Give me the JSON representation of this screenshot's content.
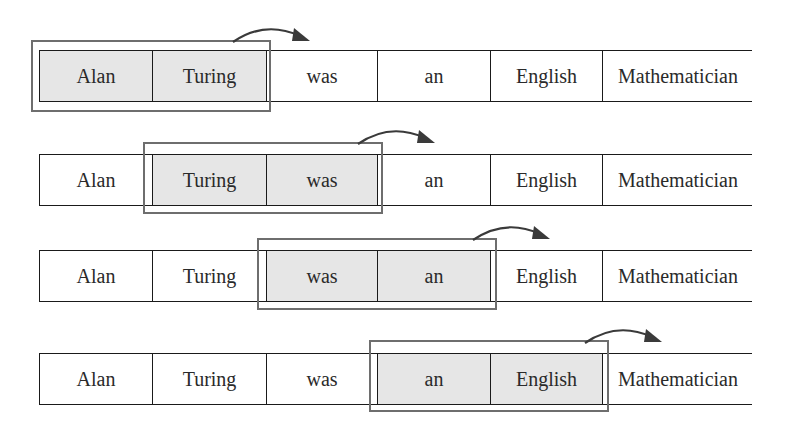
{
  "diagram": {
    "tokens": [
      "Alan",
      "Turing",
      "was",
      "an",
      "English",
      "Mathematician"
    ],
    "rows": [
      {
        "step": 1,
        "window": [
          0,
          1
        ],
        "cells": [
          "Alan",
          "Turing",
          "was",
          "an",
          "English",
          "Mathematician"
        ]
      },
      {
        "step": 2,
        "window": [
          1,
          2
        ],
        "cells": [
          "Alan",
          "Turing",
          "was",
          "an",
          "English",
          "Mathematician"
        ]
      },
      {
        "step": 3,
        "window": [
          2,
          3
        ],
        "cells": [
          "Alan",
          "Turing",
          "was",
          "an",
          "English",
          "Mathematician"
        ]
      },
      {
        "step": 4,
        "window": [
          3,
          4
        ],
        "cells": [
          "Alan",
          "Turing",
          "was",
          "an",
          "English",
          "Mathematician"
        ]
      }
    ],
    "colors": {
      "highlight": "#e6e6e6",
      "window_border": "#6e6e6e",
      "cell_border": "#1a1a1a",
      "arrow": "#3a3a3a"
    },
    "arrow_icon": "curved-arrow-right"
  }
}
